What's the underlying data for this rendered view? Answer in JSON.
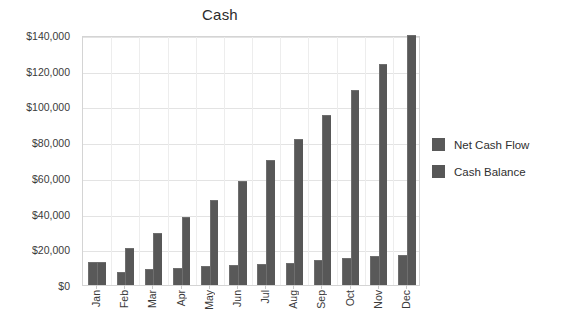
{
  "chart_data": {
    "type": "bar",
    "title": "Cash",
    "xlabel": "",
    "ylabel": "",
    "ylim": [
      0,
      140000
    ],
    "ytick_values": [
      0,
      20000,
      40000,
      60000,
      80000,
      100000,
      120000,
      140000
    ],
    "ytick_labels": [
      "$0",
      "$20,000",
      "$40,000",
      "$60,000",
      "$80,000",
      "$100,000",
      "$120,000",
      "$140,000"
    ],
    "categories": [
      "Jan",
      "Feb",
      "Mar",
      "Apr",
      "May",
      "Jun",
      "Jul",
      "Aug",
      "Sep",
      "Oct",
      "Nov",
      "Dec"
    ],
    "series": [
      {
        "name": "Net Cash Flow",
        "color": "#595959",
        "values": [
          13000,
          7500,
          9000,
          9500,
          10500,
          11000,
          12000,
          12500,
          14000,
          15000,
          16000,
          17000
        ]
      },
      {
        "name": "Cash Balance",
        "color": "#575757",
        "values": [
          13000,
          21000,
          29000,
          38000,
          47500,
          58000,
          70000,
          81500,
          95000,
          109000,
          123500,
          140000
        ]
      }
    ],
    "grid": true,
    "legend_position": "right"
  },
  "legend": {
    "items": [
      {
        "label": "Net Cash Flow"
      },
      {
        "label": "Cash Balance"
      }
    ]
  },
  "colors": {
    "bar": "#595959",
    "grid": "#e3e3e3",
    "plot_border": "#d4d4d4",
    "text": "#2f2f2f",
    "background": "#ffffff"
  }
}
